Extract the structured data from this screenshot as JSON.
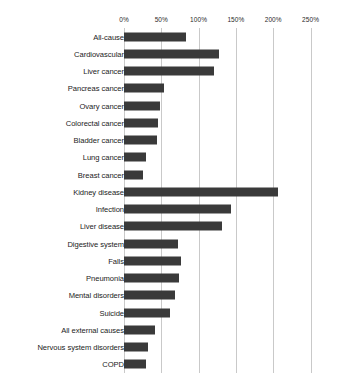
{
  "chart": {
    "title": "",
    "bar_color": "#3a3a3a",
    "gridline_color": "#c9c9c9"
  },
  "chart_data": {
    "type": "bar",
    "orientation": "horizontal",
    "title": "",
    "subtitle": "",
    "xlabel": "",
    "ylabel": "",
    "xlim": [
      0,
      250
    ],
    "xticks": [
      0,
      50,
      100,
      150,
      200,
      250
    ],
    "xtick_labels": [
      "0%",
      "50%",
      "100%",
      "150%",
      "200%",
      "250%"
    ],
    "grid": true,
    "legend": null,
    "categories": [
      "All-cause",
      "Cardiovascular",
      "Liver cancer",
      "Pancreas cancer",
      "Ovary cancer",
      "Colorectal cancer",
      "Bladder cancer",
      "Lung cancer",
      "Breast cancer",
      "Kidney disease",
      "Infection",
      "Liver disease",
      "Digestive system",
      "Falls",
      "Pneumonia",
      "Mental disorders",
      "Suicide",
      "All external causes",
      "Nervous system disorders",
      "COPD"
    ],
    "values": [
      83,
      128,
      121,
      53,
      48,
      45,
      44,
      30,
      26,
      206,
      143,
      132,
      72,
      76,
      74,
      68,
      61,
      42,
      32,
      30
    ],
    "value_unit": "%"
  }
}
